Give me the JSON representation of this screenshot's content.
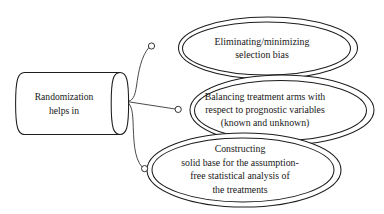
{
  "diagram": {
    "type": "flowchart",
    "title_text": "",
    "colors": {
      "stroke": "#1d1d1d",
      "text": "#171717",
      "background": "#ffffff",
      "connector": "#2a2a2a"
    },
    "source_node": {
      "shape": "cylinder",
      "lines": [
        "Randomization",
        "helps in"
      ]
    },
    "outcome_nodes": [
      {
        "shape": "double-ellipse",
        "lines": [
          "Eliminating/minimizing",
          "selection bias"
        ]
      },
      {
        "shape": "double-ellipse",
        "lines": [
          "Balancing treatment arms with",
          "respect to prognostic variables",
          "(known and unknown)"
        ]
      },
      {
        "shape": "double-ellipse",
        "lines": [
          "Constructing",
          "solid base for the assumption-",
          "free statistical analysis of",
          "the treatments"
        ]
      }
    ],
    "connectors": [
      {
        "name": "connector-to-outcome-1",
        "endpoint_marker": "circle"
      },
      {
        "name": "connector-to-outcome-2",
        "endpoint_marker": "circle"
      },
      {
        "name": "connector-to-outcome-3",
        "endpoint_marker": "circle"
      }
    ]
  }
}
